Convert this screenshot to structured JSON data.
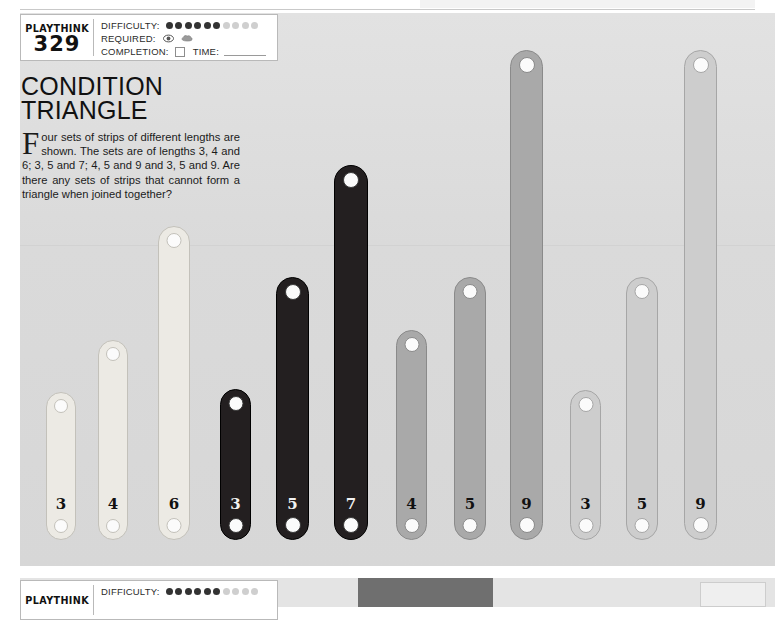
{
  "meta": {
    "brand": "PLAYTHINK",
    "number": "329",
    "difficulty_label": "DIFFICULTY:",
    "difficulty_filled": 6,
    "difficulty_total": 10,
    "required_label": "REQUIRED:",
    "required_icons": [
      "eye-icon",
      "brain-icon"
    ],
    "completion_label": "COMPLETION:",
    "time_label": "TIME:"
  },
  "puzzle": {
    "title_line1": "CONDITION",
    "title_line2": "TRIANGLE",
    "dropcap": "F",
    "body": "our sets of strips of different lengths are shown. The sets are of lengths 3, 4 and 6; 3, 5 and 7; 4, 5 and 9 and 3, 5 and 9. Are there any sets of strips that cannot form a triangle when joined together?"
  },
  "colors": {
    "panel_bg": "#dcdcdc",
    "group1_fill": "#eceae4",
    "group1_stroke": "#c3c1ba",
    "group2_fill": "#231f20",
    "group2_stroke": "#000000",
    "group3_fill": "#a9a9a9",
    "group3_stroke": "#8a8a8a",
    "group4_fill": "#cdcdcd",
    "group4_stroke": "#a6a6a6"
  },
  "chart_data": {
    "type": "bar",
    "title": "CONDITION TRIANGLE",
    "xlabel": "",
    "ylabel": "strip length",
    "categories": [
      "3",
      "4",
      "6",
      "3",
      "5",
      "7",
      "4",
      "5",
      "9",
      "3",
      "5",
      "9"
    ],
    "values": [
      3,
      4,
      6,
      3,
      5,
      7,
      4,
      5,
      9,
      3,
      5,
      9
    ],
    "groups": [
      {
        "name": "set 1",
        "values": [
          3,
          4,
          6
        ],
        "color": "#eceae4"
      },
      {
        "name": "set 2",
        "values": [
          3,
          5,
          7
        ],
        "color": "#231f20"
      },
      {
        "name": "set 3",
        "values": [
          4,
          5,
          9
        ],
        "color": "#a9a9a9"
      },
      {
        "name": "set 4",
        "values": [
          3,
          5,
          9
        ],
        "color": "#cdcdcd"
      }
    ],
    "grid": false,
    "legend": "none"
  },
  "strips": [
    {
      "label": "3",
      "group": 1,
      "x": 46,
      "top": 392,
      "w": 30,
      "h": 148
    },
    {
      "label": "4",
      "group": 1,
      "x": 98,
      "top": 340,
      "w": 30,
      "h": 200
    },
    {
      "label": "6",
      "group": 1,
      "x": 158,
      "top": 226,
      "w": 32,
      "h": 314
    },
    {
      "label": "3",
      "group": 2,
      "x": 220,
      "top": 389,
      "w": 31,
      "h": 151
    },
    {
      "label": "5",
      "group": 2,
      "x": 276,
      "top": 277,
      "w": 33,
      "h": 263
    },
    {
      "label": "7",
      "group": 2,
      "x": 334,
      "top": 165,
      "w": 34,
      "h": 375
    },
    {
      "label": "4",
      "group": 3,
      "x": 396,
      "top": 330,
      "w": 31,
      "h": 210
    },
    {
      "label": "5",
      "group": 3,
      "x": 454,
      "top": 277,
      "w": 32,
      "h": 263
    },
    {
      "label": "9",
      "group": 3,
      "x": 510,
      "top": 50,
      "w": 33,
      "h": 490
    },
    {
      "label": "3",
      "group": 4,
      "x": 570,
      "top": 390,
      "w": 31,
      "h": 150
    },
    {
      "label": "5",
      "group": 4,
      "x": 626,
      "top": 277,
      "w": 32,
      "h": 263
    },
    {
      "label": "9",
      "group": 4,
      "x": 684,
      "top": 50,
      "w": 33,
      "h": 490
    }
  ],
  "next_panel": {
    "brand": "PLAYTHINK",
    "difficulty_label": "DIFFICULTY:",
    "difficulty_filled": 6,
    "difficulty_total": 10
  }
}
